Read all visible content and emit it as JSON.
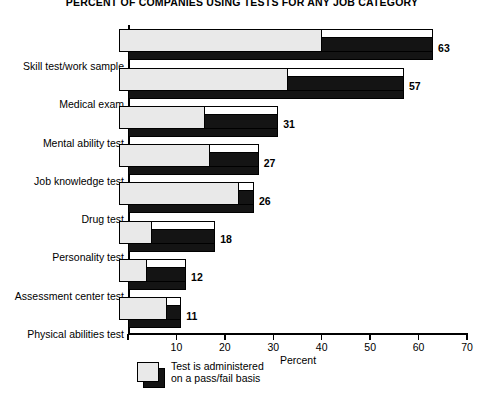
{
  "chart_data": {
    "type": "bar",
    "orientation": "horizontal",
    "title": "PERCENT OF COMPANIES USING TESTS FOR ANY JOB CATEGORY",
    "xlabel": "Percent",
    "ylabel": "",
    "xlim": [
      0,
      70
    ],
    "xticks": [
      0,
      10,
      20,
      30,
      40,
      50,
      60,
      70
    ],
    "xtick_labels": [
      "",
      "10",
      "20",
      "30",
      "40",
      "50",
      "60",
      "70"
    ],
    "grid": false,
    "legend_position": "below-left",
    "categories": [
      "Skill test/work sample",
      "Medical exam",
      "Mental ability test",
      "Job knowledge test",
      "Drug test",
      "Personality test",
      "Assessment center test",
      "Physical abilities test"
    ],
    "series": [
      {
        "name": "Percent of companies using test",
        "color": "#141414",
        "values": [
          63,
          57,
          31,
          27,
          26,
          18,
          12,
          11
        ],
        "value_labels": [
          "63",
          "57",
          "31",
          "27",
          "26",
          "18",
          "12",
          "11"
        ]
      },
      {
        "name": "Test is administered on a pass/fail basis",
        "color": "#e9e9e9",
        "values": [
          40,
          33,
          16,
          17,
          23,
          5,
          4,
          8
        ]
      }
    ],
    "legend_entries": [
      {
        "label": "Test is administered\non a pass/fail basis",
        "fill": "#e9e9e9",
        "shadow": "#141414"
      }
    ]
  }
}
